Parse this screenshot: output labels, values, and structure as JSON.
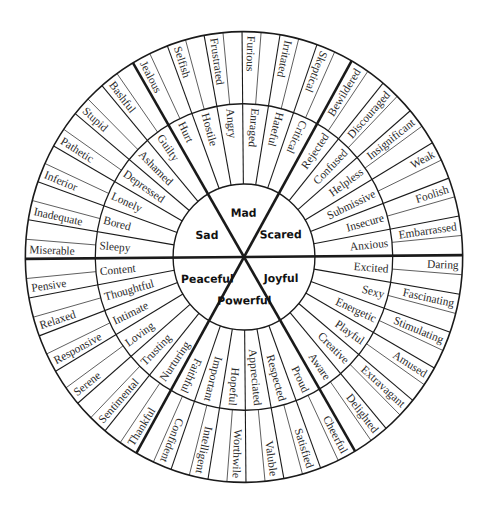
{
  "wheel": {
    "title": "Feelings Wheel",
    "line_color": "#1a1a1a",
    "text_color": "#2a2a2a",
    "background": "#ffffff",
    "center_x": 244,
    "center_y": 257,
    "radius_inner": 72,
    "radius_middle": 151,
    "radius_outer": 222,
    "core": [
      {
        "label": "Joyful",
        "start_angle": 0,
        "middle": [
          "Excited",
          "Sexy",
          "Energetic",
          "Playful",
          "Creative",
          "Aware"
        ],
        "outer": [
          "Daring",
          "Fascinating",
          "Stimulating",
          "Amused",
          "Extravagant",
          "Delighted"
        ],
        "reads": "outward"
      },
      {
        "label": "Powerful",
        "start_angle": 60,
        "middle": [
          "Proud",
          "Respected",
          "Appreciated",
          "Hopeful",
          "Important",
          "Faithful"
        ],
        "outer": [
          "Cheerful",
          "Satisfied",
          "Valuble",
          "Worthwile",
          "Intelligent",
          "Confident"
        ],
        "reads": "outward"
      },
      {
        "label": "Peaceful",
        "start_angle": 120,
        "middle": [
          "Nurturing",
          "Trusting",
          "Loving",
          "Intimate",
          "Thoughtful",
          "Content"
        ],
        "outer": [
          "Thankful",
          "Sentimental",
          "Serene",
          "Responsive",
          "Relaxed",
          "Pensive"
        ],
        "reads": "inward"
      },
      {
        "label": "Sad",
        "start_angle": 180,
        "middle": [
          "Sleepy",
          "Bored",
          "Lonely",
          "Depressed",
          "Ashamed",
          "Guilty"
        ],
        "outer": [
          "Miserable",
          "Inadequate",
          "Inferior",
          "Pathetic",
          "Stupid",
          "Bashful"
        ],
        "reads": "inward"
      },
      {
        "label": "Mad",
        "start_angle": 240,
        "middle": [
          "Hurt",
          "Hostile",
          "Angry",
          "Enraged",
          "Hateful",
          "Critical"
        ],
        "outer": [
          "Jealous",
          "Selfish",
          "Frustrated",
          "Furious",
          "Irritated",
          "Skeptical"
        ],
        "reads": "inward"
      },
      {
        "label": "Scared",
        "start_angle": 300,
        "middle": [
          "Rejected",
          "Confused",
          "Helpless",
          "Submissive",
          "Insecure",
          "Anxious"
        ],
        "outer": [
          "Bewildered",
          "Discouraged",
          "Insignificant",
          "Weak",
          "Foolish",
          "Embarrassed"
        ],
        "reads": "outward"
      }
    ]
  }
}
